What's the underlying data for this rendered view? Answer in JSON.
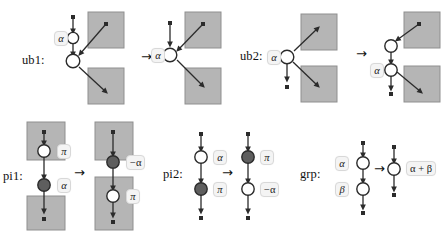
{
  "figure": {
    "type": "rewrite-rule-diagram",
    "rewrite_arrow": "→",
    "colors": {
      "box_fill": "#b5b5b5",
      "box_border": "#8f8f8f",
      "node_white_fill": "#ffffff",
      "node_dark_fill": "#5e5e5e",
      "node_stroke": "#2b2b2b",
      "edge": "#2b2b2b",
      "chip_bg": "#f4f4f4",
      "chip_border": "#d8d8d8",
      "text": "#1a1a1a",
      "page_bg": "#ffffff"
    }
  },
  "rules": [
    {
      "id": "ub1",
      "name": "ub1:",
      "lhs_labels": [
        "α"
      ],
      "rhs_labels": [
        "α"
      ],
      "lhs_nodes": [
        "white",
        "white"
      ],
      "rhs_nodes": [
        "white"
      ],
      "boxes_lhs": 2,
      "boxes_rhs": 2
    },
    {
      "id": "ub2",
      "name": "ub2:",
      "lhs_labels": [
        "α"
      ],
      "rhs_labels": [
        "α"
      ],
      "lhs_nodes": [
        "white"
      ],
      "rhs_nodes": [
        "white",
        "white"
      ],
      "boxes_lhs": 2,
      "boxes_rhs": 2
    },
    {
      "id": "pi1",
      "name": "pi1:",
      "lhs_labels": [
        "π",
        "α"
      ],
      "rhs_labels": [
        "−α",
        "π"
      ],
      "lhs_nodes": [
        "white",
        "dark"
      ],
      "rhs_nodes": [
        "dark",
        "white"
      ],
      "boxes_lhs": 2,
      "boxes_rhs": 2
    },
    {
      "id": "pi2",
      "name": "pi2:",
      "lhs_labels": [
        "α",
        "π"
      ],
      "rhs_labels": [
        "π",
        "−α"
      ],
      "lhs_nodes": [
        "white",
        "dark"
      ],
      "rhs_nodes": [
        "dark",
        "white"
      ],
      "boxes_lhs": 0,
      "boxes_rhs": 0
    },
    {
      "id": "grp",
      "name": "grp:",
      "lhs_labels": [
        "α",
        "β"
      ],
      "rhs_labels": [
        "α + β"
      ],
      "lhs_nodes": [
        "white",
        "white"
      ],
      "rhs_nodes": [
        "white"
      ],
      "boxes_lhs": 0,
      "boxes_rhs": 0
    }
  ]
}
